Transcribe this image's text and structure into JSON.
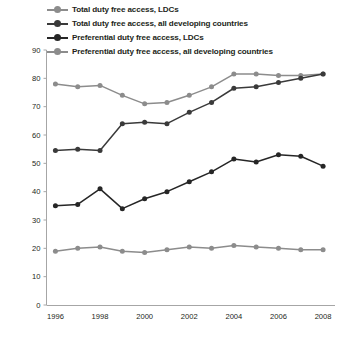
{
  "chart_data": {
    "type": "line",
    "title": "",
    "xlabel": "",
    "ylabel": "",
    "x": [
      1996,
      1997,
      1998,
      1999,
      2000,
      2001,
      2002,
      2003,
      2004,
      2005,
      2006,
      2007,
      2008
    ],
    "xlim": [
      1995.6,
      2008.4
    ],
    "ylim": [
      0,
      90
    ],
    "xticks": [
      1996,
      1998,
      2000,
      2002,
      2004,
      2006,
      2008
    ],
    "xtick_labels": [
      "1996",
      "1998",
      "2000",
      "2002",
      "2004",
      "2006",
      "2008"
    ],
    "yticks": [
      0,
      10,
      20,
      30,
      40,
      50,
      60,
      70,
      80,
      90
    ],
    "ytick_labels": [
      "0",
      "10",
      "20",
      "30",
      "40",
      "50",
      "60",
      "70",
      "80",
      "90"
    ],
    "grid": false,
    "legend_position": "top-left",
    "series": [
      {
        "name": "Total duty free access, LDCs",
        "color": "#8c8c8c",
        "marker": "circle",
        "values": [
          78,
          77,
          77.5,
          74,
          71,
          71.5,
          74,
          77,
          81.5,
          81.5,
          81,
          81,
          81.5
        ]
      },
      {
        "name": "Total duty free access, all developing countries",
        "color": "#3a3a3a",
        "marker": "circle",
        "values": [
          54.5,
          55,
          54.5,
          64,
          64.5,
          64,
          68,
          71.5,
          76.5,
          77,
          78.5,
          80,
          81.5
        ]
      },
      {
        "name": "Preferential duty free access, LDCs",
        "color": "#262626",
        "marker": "circle",
        "values": [
          35,
          35.5,
          41,
          34,
          37.5,
          40,
          43.5,
          47,
          51.5,
          50.5,
          53,
          52.5,
          49
        ]
      },
      {
        "name": "Preferential duty free access, all developing countries",
        "color": "#8c8c8c",
        "marker": "circle",
        "values": [
          19,
          20,
          20.5,
          19,
          18.5,
          19.5,
          20.5,
          20,
          21,
          20.5,
          20,
          19.5,
          19.5
        ]
      }
    ]
  },
  "legend": {
    "items": [
      {
        "label": "Total duty free access, LDCs",
        "color": "#8c8c8c"
      },
      {
        "label": "Total duty free access, all developing countries",
        "color": "#3a3a3a"
      },
      {
        "label": "Preferential duty free access, LDCs",
        "color": "#262626"
      },
      {
        "label": "Preferential duty free access, all developing countries",
        "color": "#8c8c8c"
      }
    ]
  }
}
